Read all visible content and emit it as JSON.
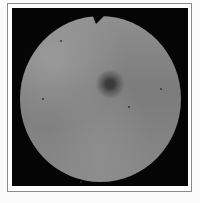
{
  "image": {
    "subject": "fundus-photograph",
    "description": "Grayscale circular fundus image with dark central macula and a notch at the top edge, inside a black square on a framed white page",
    "colors": {
      "page": "#fbfbfb",
      "frame_border": "#8a8a8a",
      "background": "#050505",
      "fundus_mid": "#808080",
      "macula": "#3a3a3a"
    }
  }
}
